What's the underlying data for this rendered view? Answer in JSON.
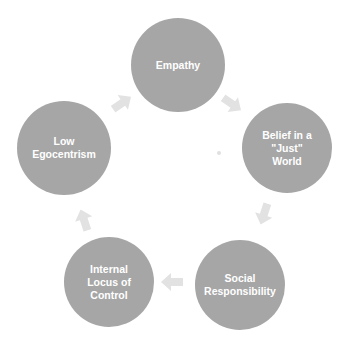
{
  "diagram": {
    "type": "cycle",
    "colors": {
      "node": "#a6a6a6",
      "node_text": "#ffffff",
      "arrow": "#e2e2e2",
      "background": "#ffffff"
    },
    "nodes": [
      {
        "id": "empathy",
        "label": "Empathy",
        "cx": 178,
        "cy": 65,
        "r": 47
      },
      {
        "id": "belief",
        "label": "Belief in a\n\"Just\"\nWorld",
        "cx": 287,
        "cy": 148,
        "r": 45
      },
      {
        "id": "social",
        "label": "Social\nResponsibility",
        "cx": 240,
        "cy": 285,
        "r": 45
      },
      {
        "id": "internal",
        "label": "Internal\nLocus of\nControl",
        "cx": 109,
        "cy": 282,
        "r": 45
      },
      {
        "id": "low-ego",
        "label": "Low\nEgocentrism",
        "cx": 64,
        "cy": 148,
        "r": 47
      }
    ],
    "arrows": [
      {
        "from": "empathy",
        "to": "belief",
        "x": 232,
        "y": 104,
        "angle": 35
      },
      {
        "from": "belief",
        "to": "social",
        "x": 264,
        "y": 214,
        "angle": 108
      },
      {
        "from": "social",
        "to": "internal",
        "x": 172,
        "y": 282,
        "angle": 180
      },
      {
        "from": "internal",
        "to": "low-ego",
        "x": 84,
        "y": 220,
        "angle": 252
      },
      {
        "from": "low-ego",
        "to": "empathy",
        "x": 122,
        "y": 103,
        "angle": 325
      }
    ]
  }
}
